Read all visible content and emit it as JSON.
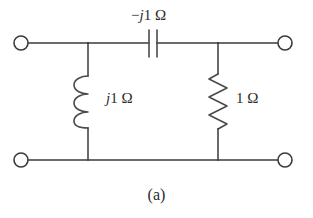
{
  "figure": {
    "caption": "(a)",
    "ink_color": "#3a3a3a",
    "background_color": "#ffffff",
    "text_color": "#2b2b2b"
  },
  "components": {
    "capacitor": {
      "name": "series capacitor",
      "symbol": "capacitor-symbol",
      "sign": "−",
      "imaginary_unit": "j",
      "magnitude": "1",
      "unit": "Ω",
      "label": "−j1 Ω",
      "position": "series-top-branch"
    },
    "inductor": {
      "name": "shunt inductor",
      "symbol": "inductor-coil-symbol",
      "imaginary_unit": "j",
      "magnitude": "1",
      "unit": "Ω",
      "label": "j1 Ω",
      "position": "shunt-left-branch"
    },
    "resistor": {
      "name": "shunt resistor",
      "symbol": "resistor-zigzag-symbol",
      "magnitude": "1",
      "unit": "Ω",
      "label": "1 Ω",
      "position": "shunt-right-branch"
    }
  },
  "terminals": [
    {
      "id": "input-top",
      "shape": "open-circle"
    },
    {
      "id": "input-bottom",
      "shape": "open-circle"
    },
    {
      "id": "output-top",
      "shape": "open-circle"
    },
    {
      "id": "output-bottom",
      "shape": "open-circle"
    }
  ]
}
